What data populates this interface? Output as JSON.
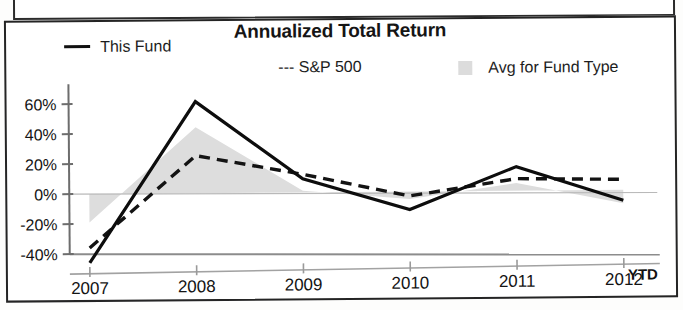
{
  "chart_data": {
    "type": "line",
    "title": "Annualized Total Return",
    "xlabel": "",
    "ylabel": "",
    "x": [
      "2007",
      "2008",
      "2009",
      "2010",
      "2011",
      "2012"
    ],
    "x_suffix_label": "YTD",
    "categories": [
      "2007",
      "2008",
      "2009",
      "2010",
      "2011",
      "2012"
    ],
    "ylim": [
      -50,
      65
    ],
    "ytick_values": [
      60,
      40,
      20,
      0,
      -20,
      -40
    ],
    "ytick_labels": [
      "60%",
      "40%",
      "20%",
      "0%",
      "-20%",
      "-40%"
    ],
    "grid": false,
    "legend_position": "top",
    "series": [
      {
        "name": "This Fund",
        "style": "solid-line",
        "color": "#101010",
        "values": [
          -46,
          61,
          9,
          -12,
          16,
          -7
        ]
      },
      {
        "name": "S&P 500",
        "style": "dashed-line",
        "color": "#101010",
        "values": [
          -36,
          25,
          12,
          -3,
          8,
          7
        ]
      },
      {
        "name": "Avg for Fund Type",
        "style": "filled-area",
        "color": "#dcdcdc",
        "values": [
          -19,
          44,
          1,
          -5,
          5,
          -9
        ]
      }
    ]
  },
  "legend": {
    "this_fund": "This Fund",
    "sp500": "--- S&P 500",
    "avg_fund_type": "Avg for Fund Type"
  },
  "axis": {
    "ytick_0": "60%",
    "ytick_1": "40%",
    "ytick_2": "20%",
    "ytick_3": "0%",
    "ytick_4": "-20%",
    "ytick_5": "-40%",
    "xtick_0": "2007",
    "xtick_1": "2008",
    "xtick_2": "2009",
    "xtick_3": "2010",
    "xtick_4": "2011",
    "xtick_5": "2012",
    "ytd": "YTD"
  }
}
